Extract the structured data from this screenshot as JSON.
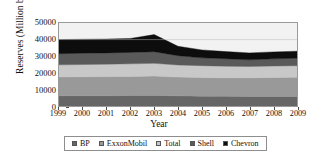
{
  "chart_data": {
    "type": "area",
    "stacked": true,
    "title": "",
    "xlabel": "Year",
    "ylabel": "Reserves (Million barrels)",
    "categories": [
      "1999",
      "2000",
      "2001",
      "2002",
      "2003",
      "2004",
      "2005",
      "2006",
      "2007",
      "2008",
      "2009"
    ],
    "x": [
      1999,
      2000,
      2001,
      2002,
      2003,
      2004,
      2005,
      2006,
      2007,
      2008,
      2009
    ],
    "ylim": [
      0,
      50000
    ],
    "yticks": [
      0,
      10000,
      20000,
      30000,
      40000,
      50000
    ],
    "ytick_labels": [
      "0",
      "10000",
      "20000",
      "30000",
      "40000",
      "50000"
    ],
    "grid": false,
    "legend_position": "bottom",
    "series": [
      {
        "name": "BP",
        "color": "#666666",
        "values": [
          6200,
          6200,
          6200,
          6300,
          6400,
          6100,
          5900,
          5800,
          5700,
          5700,
          5700
        ]
      },
      {
        "name": "ExxonMobil",
        "color": "#999999",
        "values": [
          11300,
          11400,
          11500,
          11500,
          11600,
          11300,
          11200,
          11200,
          11300,
          11500,
          11600
        ]
      },
      {
        "name": "Total",
        "color": "#c8c8c8",
        "values": [
          7300,
          7400,
          7500,
          7600,
          7700,
          7300,
          7200,
          7000,
          6800,
          6900,
          7000
        ]
      },
      {
        "name": "Shell",
        "color": "#5a5a5a",
        "values": [
          6700,
          6800,
          6800,
          6900,
          7000,
          5600,
          4700,
          4500,
          4000,
          4300,
          4500
        ]
      },
      {
        "name": "Chevron",
        "color": "#0d0d0d",
        "values": [
          8500,
          8400,
          8300,
          8400,
          10300,
          5700,
          4800,
          4300,
          4200,
          4200,
          4200
        ]
      }
    ],
    "stack_totals": [
      40000,
      40200,
      40300,
      40700,
      43000,
      36000,
      33800,
      32800,
      32000,
      32600,
      33000
    ],
    "plot_bgcolor": "#f2f2f2",
    "axis_color": "#9a9a9a"
  },
  "legend": {
    "items": [
      {
        "label": "BP"
      },
      {
        "label": "ExxonMobil"
      },
      {
        "label": "Total"
      },
      {
        "label": "Shell"
      },
      {
        "label": "Chevron"
      }
    ]
  }
}
